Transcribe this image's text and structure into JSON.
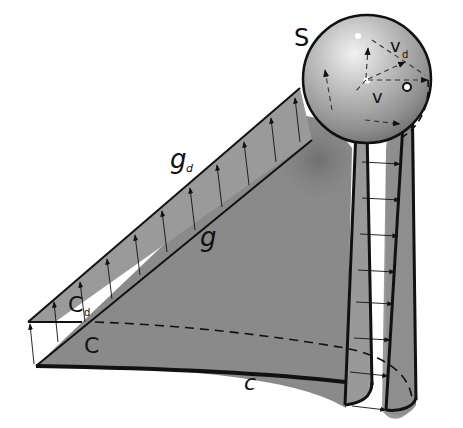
{
  "figure": {
    "labels": {
      "S": "S",
      "v_d": "v",
      "v_d_sub": "d",
      "v": "v",
      "g_d": "g",
      "g_d_sub": "d",
      "g": "g",
      "C_d": "C",
      "C_d_sub": "d",
      "C": "C",
      "c": "c"
    },
    "colors": {
      "surface": "#8a8a8a",
      "surface_dark": "#7a7a7a",
      "band": "#9a9a9a",
      "line": "#111111",
      "sphere_light": "#e8e8e8",
      "sphere_dark": "#6a6a6a",
      "background": "#ffffff"
    }
  }
}
